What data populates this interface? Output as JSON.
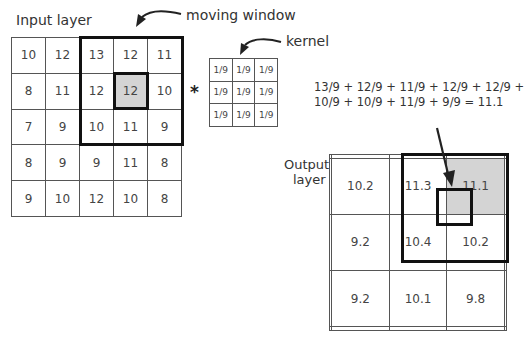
{
  "labels": {
    "input_layer": "Input layer",
    "moving_window": "moving window",
    "kernel": "kernel",
    "output_layer_line1": "Output",
    "output_layer_line2": "layer",
    "operator": "*"
  },
  "equation": {
    "line1": "13/9 + 12/9 + 11/9 + 12/9 + 12/9 +",
    "line2": "10/9 + 10/9 + 11/9 + 9/9 = 11.1"
  },
  "input_grid": [
    [
      "10",
      "12",
      "13",
      "12",
      "11"
    ],
    [
      "8",
      "11",
      "12",
      "12",
      "10"
    ],
    [
      "7",
      "9",
      "10",
      "11",
      "9"
    ],
    [
      "8",
      "9",
      "9",
      "11",
      "8"
    ],
    [
      "9",
      "10",
      "12",
      "10",
      "8"
    ]
  ],
  "kernel_grid": [
    [
      "1/9",
      "1/9",
      "1/9"
    ],
    [
      "1/9",
      "1/9",
      "1/9"
    ],
    [
      "1/9",
      "1/9",
      "1/9"
    ]
  ],
  "output_grid": [
    [
      "",
      "",
      "",
      "",
      ""
    ],
    [
      "",
      "10.2",
      "11.3",
      "11.1",
      ""
    ],
    [
      "",
      "9.2",
      "10.4",
      "10.2",
      ""
    ],
    [
      "",
      "9.2",
      "10.1",
      "9.8",
      ""
    ],
    [
      "",
      "",
      "",
      "",
      ""
    ]
  ],
  "colors": {
    "highlight_cell": "#d4d4d4",
    "window_border": "#111111",
    "grid_line": "#555555"
  }
}
